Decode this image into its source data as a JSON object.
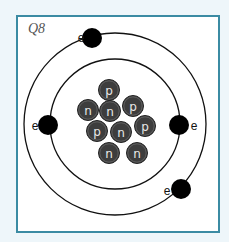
{
  "question_label": "Q8",
  "colors": {
    "background": "#eef6fa",
    "frame_border": "#3b8ba3",
    "panel": "#ffffff",
    "orbit": "#111111",
    "electron": "#000000",
    "nucleon_fill": "#3d3d3d",
    "nucleon_stroke": "#222222",
    "nucleon_text": "#e8e8e8"
  },
  "atom": {
    "center": [
      115,
      124
    ],
    "orbits": [
      {
        "name": "inner-orbit",
        "radius": 65
      },
      {
        "name": "outer-orbit",
        "radius": 91
      }
    ],
    "electrons": [
      {
        "label": "e",
        "x": 92,
        "y": 38,
        "label_x": 81,
        "label_y": 42
      },
      {
        "label": "e",
        "x": 48,
        "y": 125,
        "label_x": 35,
        "label_y": 130
      },
      {
        "label": "e",
        "x": 179,
        "y": 125,
        "label_x": 194,
        "label_y": 130
      },
      {
        "label": "e",
        "x": 181,
        "y": 189,
        "label_x": 167,
        "label_y": 195
      }
    ],
    "nucleus": [
      {
        "label": "p",
        "x": 109,
        "y": 90
      },
      {
        "label": "n",
        "x": 88,
        "y": 110
      },
      {
        "label": "n",
        "x": 110,
        "y": 111
      },
      {
        "label": "p",
        "x": 133,
        "y": 106
      },
      {
        "label": "p",
        "x": 145,
        "y": 126
      },
      {
        "label": "p",
        "x": 97,
        "y": 131
      },
      {
        "label": "n",
        "x": 121,
        "y": 132
      },
      {
        "label": "n",
        "x": 109,
        "y": 153
      },
      {
        "label": "n",
        "x": 137,
        "y": 153
      }
    ],
    "counts": {
      "protons": 4,
      "neutrons": 5,
      "electrons": 4
    }
  }
}
